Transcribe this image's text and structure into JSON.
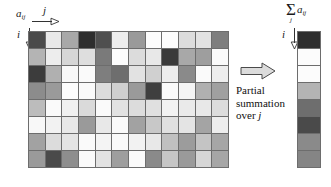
{
  "labels": {
    "matrix_symbol": "a",
    "matrix_subscript": "ij",
    "j_axis": "j",
    "i_axis": "i",
    "sigma": "Σ",
    "sigma_subscript": "j",
    "sum_operand": "a",
    "sum_operand_subscript": "ij",
    "caption_line1": "Partial",
    "caption_line2": "summation",
    "caption_line3_prefix": "over ",
    "caption_line3_var": "j"
  },
  "icons": {
    "j_arrow": "arrow-right-icon",
    "i_arrow": "arrow-down-icon",
    "transform_arrow": "block-arrow-right-icon"
  },
  "colors": {
    "grid_line": "#6d6d6d",
    "background": "#ffffff",
    "text": "#111111"
  },
  "chart_data": {
    "type": "heatmap",
    "title": "",
    "xlabel": "j",
    "ylabel": "i",
    "rows": 8,
    "cols": 12,
    "colormap": "grayscale",
    "note": "Matrix a_ij rendered as grayscale heatmap; right bar is sum over j for each i.",
    "cells": [
      [
        "#4a4a4a",
        "#e8e8e8",
        "#a8a8a8",
        "#2e2e2e",
        "#4f4f4f",
        "#ededed",
        "#9a9a9a",
        "#fcfcfc",
        "#fcfcfc",
        "#dcdcdc",
        "#e2e2e2",
        "#7e7e7e"
      ],
      [
        "#b4b4b4",
        "#ededed",
        "#d6d6d6",
        "#dedede",
        "#7a7a7a",
        "#fcfcfc",
        "#dcdcdc",
        "#e8e8e8",
        "#3a3a3a",
        "#a8a8a8",
        "#9e9e9e",
        "#fafafa"
      ],
      [
        "#3c3c3c",
        "#b0b0b0",
        "#f8f8f8",
        "#fafafa",
        "#7e7e7e",
        "#6e6e6e",
        "#e2e2e2",
        "#d0d0d0",
        "#ededed",
        "#8a8a8a",
        "#fafafa",
        "#ededed"
      ],
      [
        "#8c8c8c",
        "#9a9a9a",
        "#fcfcfc",
        "#fafafa",
        "#dcdcdc",
        "#cfcfcf",
        "#9a9a9a",
        "#3f3f3f",
        "#fafafa",
        "#f4f4f4",
        "#b0b0b0",
        "#a0a0a0"
      ],
      [
        "#bcbcbc",
        "#fafafa",
        "#f0f0f0",
        "#dadada",
        "#fafafa",
        "#e2e2e2",
        "#dcdcdc",
        "#e0e0e0",
        "#f2f2f2",
        "#eaeaea",
        "#e8e8e8",
        "#dcdcdc"
      ],
      [
        "#f8f8f8",
        "#f2f2f2",
        "#e8e8e8",
        "#9a9a9a",
        "#e8e8e8",
        "#fafafa",
        "#a2a2a2",
        "#c8c8c8",
        "#e0e0e0",
        "#e4e4e4",
        "#a4a4a4",
        "#ededed"
      ],
      [
        "#a2a2a2",
        "#dcdcdc",
        "#e4e4e4",
        "#fafafa",
        "#f4f4f4",
        "#fafafa",
        "#f2f2f2",
        "#e8e8e8",
        "#c0c0c0",
        "#9c9c9c",
        "#c4c4c4",
        "#a6a6a6"
      ],
      [
        "#9a9a9a",
        "#4a4a4a",
        "#8e8e8e",
        "#fafafa",
        "#e2e2e2",
        "#9e9e9e",
        "#fafafa",
        "#8a8a8a",
        "#c6c6c6",
        "#9a9a9a",
        "#d6d6d6",
        "#a6a6a6"
      ]
    ],
    "sum_bar": [
      "#2e2e2e",
      "#fcfcfc",
      "#fcfcfc",
      "#b4b4b4",
      "#6e6e6e",
      "#4a4a4a",
      "#8a8a8a",
      "#858585"
    ]
  }
}
